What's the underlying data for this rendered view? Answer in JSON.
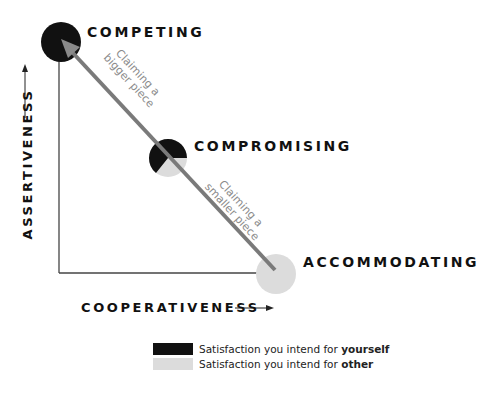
{
  "colors": {
    "self": "#111111",
    "other": "#dcdcdc",
    "arrow": "#7a7a7a",
    "axis": "#444444",
    "annotation": "#8a8a8a"
  },
  "modes": {
    "competing": "COMPETING",
    "compromising": "COMPROMISING",
    "accommodating": "ACCOMMODATING"
  },
  "axes": {
    "y_label": "ASSERTIVENESS",
    "x_label": "COOPERATIVENESS"
  },
  "annotations": {
    "upper_line1": "Claiming a",
    "upper_line2": "bigger piece",
    "lower_line1": "Claiming a",
    "lower_line2": "smaller piece"
  },
  "legend": {
    "items": [
      {
        "prefix": "Satisfaction you intend for ",
        "emphasis": "yourself",
        "color": "#111111"
      },
      {
        "prefix": "Satisfaction you intend for ",
        "emphasis": "other",
        "color": "#dcdcdc"
      }
    ]
  }
}
